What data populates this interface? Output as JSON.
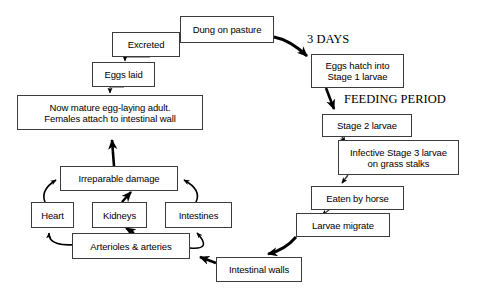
{
  "diagram": {
    "background_color": "#ffffff",
    "box_border_color": "#3c3c3c",
    "arrow_color": "#000000",
    "nodes": [
      {
        "id": "dung-on-pasture",
        "label": "Dung on pasture",
        "x": 180,
        "y": 16,
        "w": 94,
        "h": 27
      },
      {
        "id": "excreted",
        "label": "Excreted",
        "x": 112,
        "y": 32,
        "w": 68,
        "h": 25
      },
      {
        "id": "eggs-laid",
        "label": "Eggs laid",
        "x": 92,
        "y": 62,
        "w": 63,
        "h": 25
      },
      {
        "id": "mature-adult",
        "label": "Now mature egg-laying adult.\nFemales attach to intestinal wall",
        "x": 17,
        "y": 95,
        "w": 186,
        "h": 35
      },
      {
        "id": "irreparable-damage",
        "label": "Irreparable damage",
        "x": 60,
        "y": 166,
        "w": 118,
        "h": 25
      },
      {
        "id": "heart",
        "label": "Heart",
        "x": 31,
        "y": 202,
        "w": 43,
        "h": 26
      },
      {
        "id": "kidneys",
        "label": "Kidneys",
        "x": 92,
        "y": 202,
        "w": 55,
        "h": 26
      },
      {
        "id": "intestines",
        "label": "Intestines",
        "x": 165,
        "y": 202,
        "w": 67,
        "h": 26
      },
      {
        "id": "arterioles",
        "label": "Arterioles & arteries",
        "x": 72,
        "y": 233,
        "w": 118,
        "h": 26
      },
      {
        "id": "intestinal-walls",
        "label": "Intestinal walls",
        "x": 216,
        "y": 257,
        "w": 86,
        "h": 25
      },
      {
        "id": "larvae-migrate",
        "label": "Larvae migrate",
        "x": 296,
        "y": 213,
        "w": 94,
        "h": 24
      },
      {
        "id": "eaten-by-horse",
        "label": "Eaten by horse",
        "x": 311,
        "y": 186,
        "w": 93,
        "h": 24
      },
      {
        "id": "infective-stage3",
        "label": "Infective Stage 3 larvae\non grass stalks",
        "x": 338,
        "y": 140,
        "w": 121,
        "h": 35
      },
      {
        "id": "stage-2-larvae",
        "label": "Stage 2 larvae",
        "x": 322,
        "y": 114,
        "w": 90,
        "h": 23
      },
      {
        "id": "eggs-hatch",
        "label": "Eggs hatch into\nStage 1 larvae",
        "x": 311,
        "y": 54,
        "w": 93,
        "h": 34
      }
    ],
    "labels": [
      {
        "id": "three-days",
        "text": "3 DAYS",
        "x": 307,
        "y": 33
      },
      {
        "id": "feeding-period",
        "text": "FEEDING PERIOD",
        "x": 344,
        "y": 93
      }
    ],
    "edges": [
      {
        "from": "dung-on-pasture",
        "to": "excreted",
        "style": "thin"
      },
      {
        "from": "excreted",
        "to": "eggs-laid",
        "style": "thin"
      },
      {
        "from": "eggs-laid",
        "to": "mature-adult",
        "style": "thin"
      },
      {
        "from": "irreparable-damage",
        "to": "mature-adult",
        "style": "thick"
      },
      {
        "from": "heart",
        "to": "irreparable-damage",
        "style": "thin"
      },
      {
        "from": "kidneys",
        "to": "irreparable-damage",
        "style": "thick"
      },
      {
        "from": "intestines",
        "to": "irreparable-damage",
        "style": "thin"
      },
      {
        "from": "arterioles",
        "to": "heart",
        "style": "thin"
      },
      {
        "from": "arterioles",
        "to": "kidneys",
        "style": "thick"
      },
      {
        "from": "arterioles",
        "to": "intestines",
        "style": "thin"
      },
      {
        "from": "intestinal-walls",
        "to": "arterioles",
        "style": "thick"
      },
      {
        "from": "larvae-migrate",
        "to": "intestinal-walls",
        "style": "thick"
      },
      {
        "from": "eaten-by-horse",
        "to": "larvae-migrate",
        "style": "thin"
      },
      {
        "from": "infective-stage3",
        "to": "eaten-by-horse",
        "style": "thin"
      },
      {
        "from": "stage-2-larvae",
        "to": "infective-stage3",
        "style": "thin"
      },
      {
        "from": "eggs-hatch",
        "to": "stage-2-larvae",
        "style": "thick"
      },
      {
        "from": "dung-on-pasture",
        "to": "eggs-hatch",
        "style": "thick"
      }
    ]
  }
}
